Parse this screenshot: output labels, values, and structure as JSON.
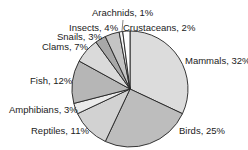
{
  "chart_data": {
    "type": "pie",
    "title": "",
    "start_angle": "12 o'clock, clockwise",
    "slices": [
      {
        "label": "Mammals",
        "value": 32,
        "text": "Mammals, 32%",
        "color": "#dcdcdc"
      },
      {
        "label": "Birds",
        "value": 25,
        "text": "Birds, 25%",
        "color": "#bdbdbd"
      },
      {
        "label": "Reptiles",
        "value": 11,
        "text": "Reptiles, 11%",
        "color": "#d2d2d2"
      },
      {
        "label": "Amphibians",
        "value": 3,
        "text": "Amphibians, 3%",
        "color": "#ebebeb"
      },
      {
        "label": "Fish",
        "value": 12,
        "text": "Fish, 12%",
        "color": "#b6b6b6"
      },
      {
        "label": "Clams",
        "value": 7,
        "text": "Clams, 7%",
        "color": "#dadada"
      },
      {
        "label": "Snails",
        "value": 3,
        "text": "Snails, 3%",
        "color": "#a8a8a8"
      },
      {
        "label": "Insects",
        "value": 4,
        "text": "Insects, 4%",
        "color": "#c4c4c4"
      },
      {
        "label": "Arachnids",
        "value": 1,
        "text": "Arachnids, 1%",
        "color": "#f4f4f4"
      },
      {
        "label": "Crustaceans",
        "value": 2,
        "text": "Crustaceans, 2%",
        "color": "#ffffff"
      }
    ]
  },
  "labels": {
    "mammals": "Mammals, 32%",
    "birds": "Birds, 25%",
    "reptiles": "Reptiles, 11%",
    "amphibians": "Amphibians, 3%",
    "fish": "Fish, 12%",
    "clams": "Clams, 7%",
    "snails": "Snails, 3%",
    "insects": "Insects, 4%",
    "arachnids": "Arachnids, 1%",
    "crustaceans": "Crustaceans, 2%"
  }
}
